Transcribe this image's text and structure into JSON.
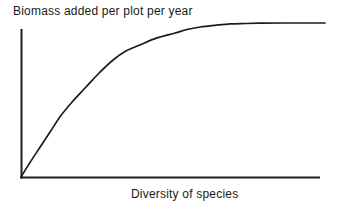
{
  "colors": {
    "ink": "#1c1c1c",
    "background": "#ffffff"
  },
  "chart_data": {
    "type": "line",
    "title": "Biomass added per plot per year",
    "xlabel": "Diversity of species",
    "ylabel": "Biomass added per plot per year",
    "x_range": [
      0,
      100
    ],
    "y_range": [
      0,
      1
    ],
    "grid": false,
    "axis_ticks": "none",
    "legend": "none",
    "series": [
      {
        "name": "biomass-vs-diversity",
        "x": [
          0,
          3.0,
          6.3,
          9.5,
          12.8,
          16.8,
          21.1,
          25.7,
          30.3,
          34.5,
          39.1,
          44.7,
          50.7,
          54.6,
          58.9,
          63.8,
          68.8,
          73.7,
          78.6,
          88.5,
          100
        ],
        "y": [
          0,
          0.095,
          0.195,
          0.29,
          0.39,
          0.487,
          0.578,
          0.675,
          0.76,
          0.818,
          0.857,
          0.903,
          0.935,
          0.958,
          0.974,
          0.985,
          0.994,
          0.997,
          0.999,
          1.0,
          1.0
        ]
      }
    ]
  }
}
